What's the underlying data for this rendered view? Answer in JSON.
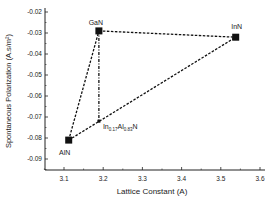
{
  "chart_data": {
    "type": "scatter",
    "title": "",
    "xlabel": "Lattice Constant (A)",
    "ylabel": "Spontaneous Polarization (A.s/m²)",
    "xlim": [
      3.05,
      3.6
    ],
    "ylim": [
      -0.095,
      -0.02
    ],
    "xticks": [
      3.1,
      3.2,
      3.3,
      3.4,
      3.5,
      3.6
    ],
    "xtick_labels": [
      "3.1",
      "3.2",
      "3.3",
      "3.4",
      "3.5",
      "3.6"
    ],
    "yticks": [
      -0.02,
      -0.03,
      -0.04,
      -0.05,
      -0.06,
      -0.07,
      -0.08,
      -0.09
    ],
    "ytick_labels": [
      "-0.02",
      "-0.03",
      "-0.04",
      "-0.05",
      "-0.06",
      "-0.07",
      "-0.08",
      "-0.09"
    ],
    "grid": false,
    "legend": null,
    "points": [
      {
        "label": "AlN",
        "x": 3.112,
        "y": -0.081,
        "marker": "square"
      },
      {
        "label": "GaN",
        "x": 3.189,
        "y": -0.029,
        "marker": "square"
      },
      {
        "label": "InN",
        "x": 3.538,
        "y": -0.032,
        "marker": "square"
      },
      {
        "label": "In0.17Al0.83N",
        "x": 3.189,
        "y": -0.072,
        "marker": "small-square"
      }
    ],
    "lines": [
      {
        "from": "AlN",
        "to": "GaN",
        "style": "dashed"
      },
      {
        "from": "GaN",
        "to": "InN",
        "style": "dashed"
      },
      {
        "from": "AlN",
        "to": "InN",
        "style": "dashed"
      },
      {
        "from": "GaN",
        "to": "In0.17Al0.83N",
        "style": "dash-dot"
      }
    ],
    "annotations": [
      {
        "text": "GaN"
      },
      {
        "text": "InN"
      },
      {
        "text": "AlN"
      },
      {
        "text": "In",
        "sub1": "0.17",
        "mid": "Al",
        "sub2": "0.83",
        "end": "N"
      }
    ]
  }
}
